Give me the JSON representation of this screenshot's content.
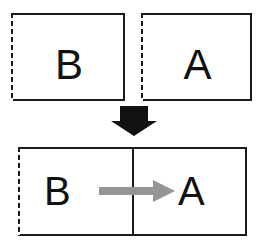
{
  "diagram": {
    "colors": {
      "stroke": "#1a1a1a",
      "fill": "#ffffff",
      "relation_arrow": "#959595",
      "transition_arrow": "#111111",
      "text": "#111111"
    },
    "top_row": {
      "boxes": [
        {
          "id": "box-b-top",
          "label": "B",
          "left_edge_style": "dashed",
          "other_edges_style": "solid"
        },
        {
          "id": "box-a-top",
          "label": "A",
          "left_edge_style": "dashed",
          "other_edges_style": "solid"
        }
      ]
    },
    "transition": {
      "icon": "down-block-arrow",
      "direction": "down",
      "color": "#111111"
    },
    "bottom_row": {
      "box": {
        "id": "box-combined",
        "left_edge_style": "dashed",
        "other_edges_style": "solid",
        "has_divider": true,
        "left_label": "B",
        "right_label": "A"
      },
      "relation": {
        "icon": "right-block-arrow",
        "direction": "right",
        "from": "B",
        "to": "A",
        "color": "#959595"
      }
    }
  }
}
